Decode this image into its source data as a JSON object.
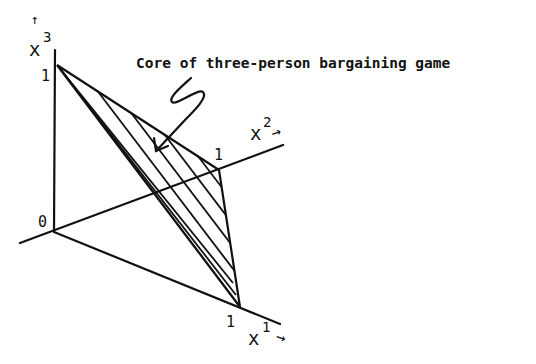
{
  "figure": {
    "caption": "Core of three-person bargaining game",
    "origin_label": "0",
    "axes": [
      {
        "name": "x1",
        "label_base": "x",
        "label_sup": "1",
        "unit_label": "1"
      },
      {
        "name": "x2",
        "label_base": "x",
        "label_sup": "2",
        "unit_label": "1"
      },
      {
        "name": "x3",
        "label_base": "x",
        "label_sup": "3",
        "unit_label": "1"
      }
    ],
    "region": "hatched triangle (core) with vertices at unit points on x1, x2, x3 axes",
    "colors": {
      "ink": "#111111",
      "background": "#ffffff"
    }
  }
}
